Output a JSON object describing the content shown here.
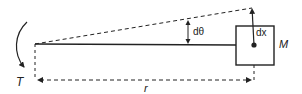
{
  "diagram": {
    "labels": {
      "torque": "T",
      "radius": "r",
      "angle": "dθ",
      "displacement": "dx",
      "mass": "M"
    },
    "colors": {
      "stroke": "#222222",
      "background": "#ffffff"
    }
  }
}
